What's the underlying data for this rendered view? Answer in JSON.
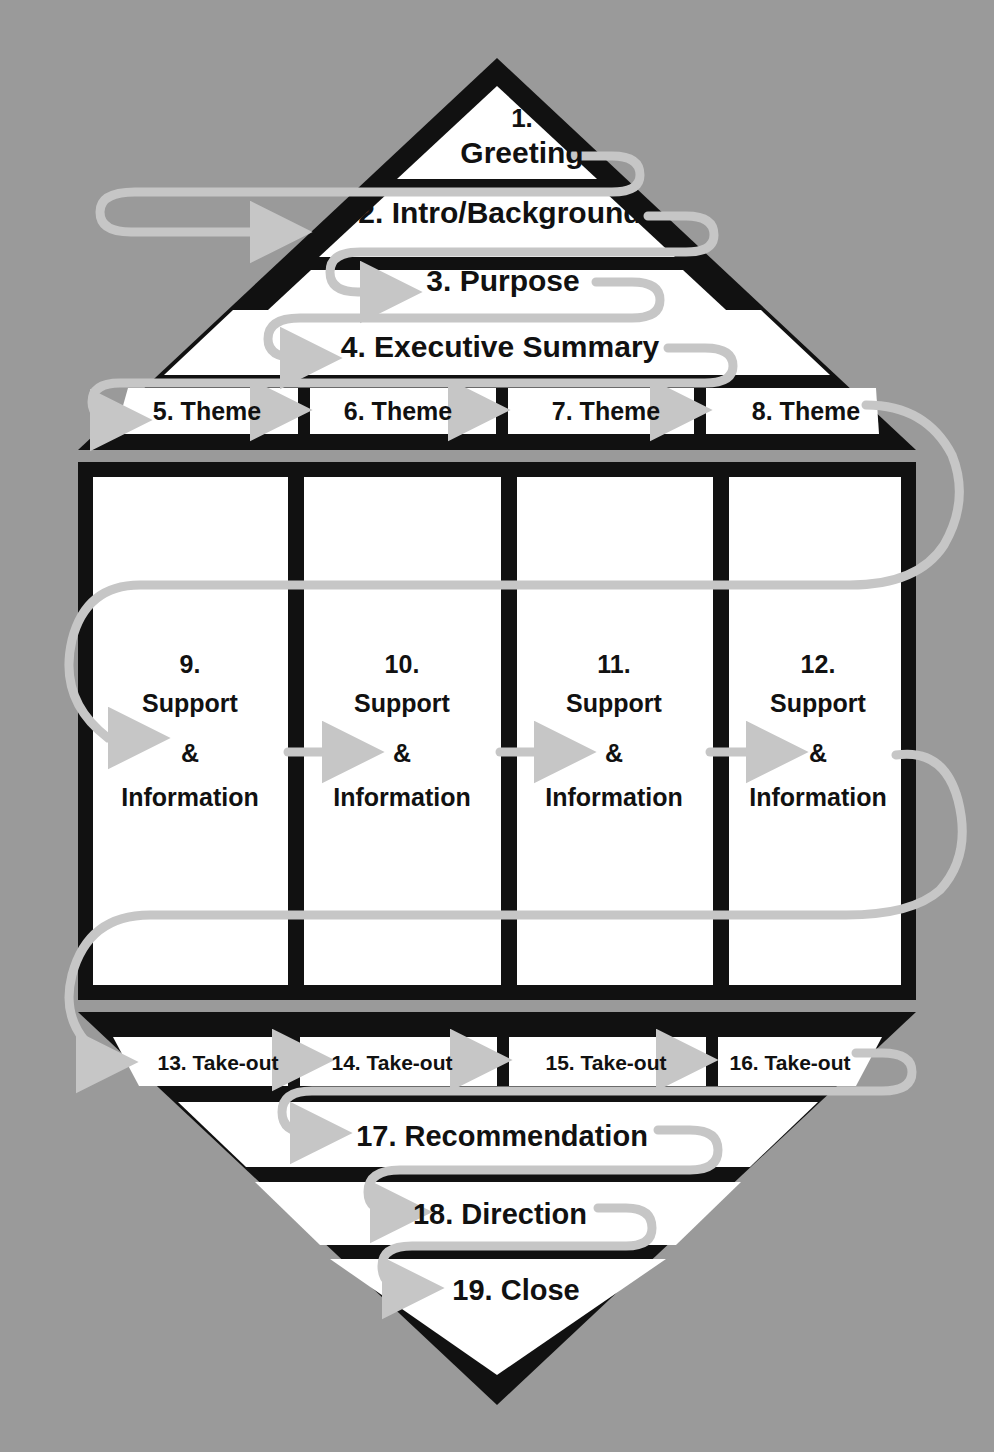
{
  "diagram": {
    "background_color": "#9a9a9a",
    "shape_fill": "#ffffff",
    "shape_outline": "#111111",
    "connector_color": "#c6c6c6",
    "text_color": "#111111"
  },
  "pyramid": {
    "rows": [
      {
        "id": "step-1",
        "label": "1.\nGreeting",
        "line1": "1.",
        "line2": "Greeting"
      },
      {
        "id": "step-2",
        "label": "2. Intro/Background"
      },
      {
        "id": "step-3",
        "label": "3. Purpose"
      },
      {
        "id": "step-4",
        "label": "4. Executive Summary"
      }
    ],
    "themes": [
      {
        "id": "step-5",
        "label": "5. Theme"
      },
      {
        "id": "step-6",
        "label": "6. Theme"
      },
      {
        "id": "step-7",
        "label": "7. Theme"
      },
      {
        "id": "step-8",
        "label": "8. Theme"
      }
    ]
  },
  "body": {
    "columns": [
      {
        "id": "step-9",
        "number": "9.",
        "line2": "Support",
        "line3": "&",
        "line4": "Information"
      },
      {
        "id": "step-10",
        "number": "10.",
        "line2": "Support",
        "line3": "&",
        "line4": "Information"
      },
      {
        "id": "step-11",
        "number": "11.",
        "line2": "Support",
        "line3": "&",
        "line4": "Information"
      },
      {
        "id": "step-12",
        "number": "12.",
        "line2": "Support",
        "line3": "&",
        "line4": "Information"
      }
    ]
  },
  "funnel": {
    "takeouts": [
      {
        "id": "step-13",
        "label": "13. Take-out"
      },
      {
        "id": "step-14",
        "label": "14. Take-out"
      },
      {
        "id": "step-15",
        "label": "15. Take-out"
      },
      {
        "id": "step-16",
        "label": "16. Take-out"
      }
    ],
    "rows": [
      {
        "id": "step-17",
        "label": "17. Recommendation"
      },
      {
        "id": "step-18",
        "label": "18. Direction"
      },
      {
        "id": "step-19",
        "label": "19. Close"
      }
    ]
  },
  "flow": {
    "sequence": [
      "1. Greeting",
      "2. Intro/Background",
      "3. Purpose",
      "4. Executive Summary",
      "5. Theme",
      "6. Theme",
      "7. Theme",
      "8. Theme",
      "9. Support & Information",
      "10. Support & Information",
      "11. Support & Information",
      "12. Support & Information",
      "13. Take-out",
      "14. Take-out",
      "15. Take-out",
      "16. Take-out",
      "17. Recommendation",
      "18. Direction",
      "19. Close"
    ],
    "step_count": 19
  }
}
